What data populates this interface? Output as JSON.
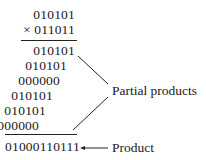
{
  "multiplication": {
    "multiplicand": "010101",
    "multiplier": "× 011011",
    "partial_products": [
      "010101",
      "010101",
      "000000",
      "010101",
      "010101",
      "000000"
    ],
    "product": "01000110111"
  },
  "labels": {
    "partial_products": "Partial products",
    "product": "Product"
  }
}
